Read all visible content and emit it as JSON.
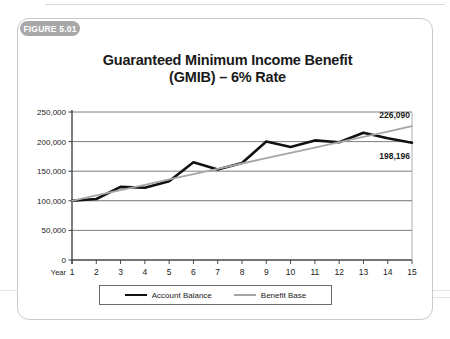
{
  "figure": {
    "badge_label": "FIGURE 5.01"
  },
  "chart_data": {
    "type": "line",
    "title": "Guaranteed Minimum Income Benefit (GMIB) – 6% Rate",
    "title_line1": "Guaranteed Minimum Income Benefit",
    "title_line2": "(GMIB) – 6% Rate",
    "xlabel": "Year",
    "ylabel": "",
    "x": [
      1,
      2,
      3,
      4,
      5,
      6,
      7,
      8,
      9,
      10,
      11,
      12,
      13,
      14,
      15
    ],
    "xtick_labels": [
      "1",
      "2",
      "3",
      "4",
      "5",
      "6",
      "7",
      "8",
      "9",
      "10",
      "11",
      "12",
      "13",
      "14",
      "15"
    ],
    "ytick_labels": [
      "0",
      "50,000",
      "100,000",
      "150,000",
      "200,000",
      "250,000"
    ],
    "ytick_values": [
      0,
      50000,
      100000,
      150000,
      200000,
      250000
    ],
    "ylim": [
      0,
      250000
    ],
    "xlim": [
      1,
      15
    ],
    "grid": true,
    "legend_position": "bottom",
    "series": [
      {
        "name": "Account Balance",
        "color": "#111111",
        "width": 2.6,
        "values": [
          100000,
          103000,
          123500,
          122000,
          133000,
          165000,
          153000,
          164000,
          200000,
          191000,
          202000,
          199000,
          215000,
          205500,
          198196
        ]
      },
      {
        "name": "Benefit Base",
        "color": "#a6a6a6",
        "width": 1.8,
        "values": [
          100000,
          109000,
          118000,
          127000,
          136000,
          145000,
          154000,
          163000,
          172000,
          181000,
          190000,
          199000,
          208000,
          217000,
          226090
        ]
      }
    ],
    "annotations": [
      {
        "text": "226,090",
        "series": "Benefit Base",
        "x": 15,
        "y": 226090
      },
      {
        "text": "198,196",
        "series": "Account Balance",
        "x": 15,
        "y": 198196
      }
    ]
  },
  "legend": {
    "items": [
      {
        "label": "Account Balance"
      },
      {
        "label": "Benefit Base"
      }
    ]
  }
}
